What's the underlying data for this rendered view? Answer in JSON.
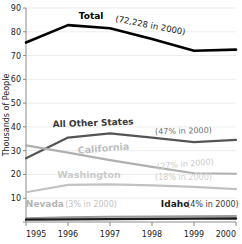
{
  "chart_data": {
    "type": "line",
    "title": "",
    "xlabel": "",
    "ylabel": "Thousands of People",
    "x": [
      1995,
      1996,
      1997,
      1998,
      1999,
      2000
    ],
    "xtick_labels": [
      "1995",
      "1996",
      "1997",
      "1998",
      "1999",
      "2000"
    ],
    "ytick_labels": [
      "0",
      "10",
      "20",
      "30",
      "40",
      "50",
      "60",
      "70",
      "80",
      "90"
    ],
    "ylim": [
      0,
      90
    ],
    "xlim": [
      1995,
      2000
    ],
    "grid": true,
    "legend_position": "inline-labels",
    "series": [
      {
        "name": "Total",
        "label": "Total",
        "annotation": "(72,228 in 2000)",
        "color": "#000000",
        "width": 2.6,
        "values": [
          75.5,
          82.8,
          81.5,
          77.0,
          72.0,
          72.5
        ]
      },
      {
        "name": "All Other States",
        "label": "All Other States",
        "annotation": "(47% in 2000)",
        "color": "#555555",
        "width": 2.2,
        "values": [
          26.8,
          35.5,
          37.3,
          35.5,
          33.6,
          34.5
        ]
      },
      {
        "name": "California",
        "label": "California",
        "annotation": "(27% in 2000)",
        "color": "#b0b0b0",
        "width": 2.2,
        "values": [
          32.2,
          29.2,
          26.0,
          23.2,
          20.5,
          20.3
        ]
      },
      {
        "name": "Washington",
        "label": "Washington",
        "annotation": "(18% in 2000)",
        "color": "#c2c2c2",
        "width": 2.2,
        "values": [
          12.5,
          15.6,
          15.8,
          15.4,
          14.8,
          13.8
        ]
      },
      {
        "name": "Nevada",
        "label": "Nevada",
        "annotation": "(3% in 2000)",
        "color": "#9a9a9a",
        "width": 2.0,
        "values": [
          1.6,
          2.0,
          2.2,
          2.3,
          2.4,
          2.5
        ]
      },
      {
        "name": "Idaho",
        "label": "Idaho",
        "annotation": "(4% in 2000)",
        "color": "#1a1a1a",
        "width": 2.4,
        "values": [
          1.0,
          1.1,
          1.2,
          1.3,
          1.4,
          1.5
        ]
      }
    ]
  },
  "axes": {
    "y_title": "Thousands of People"
  }
}
